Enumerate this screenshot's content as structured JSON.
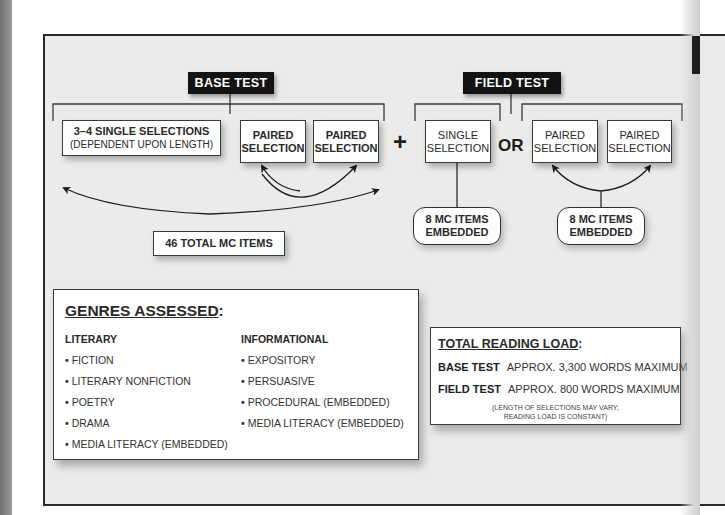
{
  "base_test": {
    "label": "BASE TEST",
    "single_selections": {
      "line1": "3–4 SINGLE SELECTIONS",
      "line2": "(DEPENDENT UPON LENGTH)"
    },
    "paired_selection_1": {
      "line1": "PAIRED",
      "line2": "SELECTION"
    },
    "paired_selection_2": {
      "line1": "PAIRED",
      "line2": "SELECTION"
    },
    "total_items": "46 TOTAL MC ITEMS"
  },
  "operators": {
    "plus": "+",
    "or": "OR"
  },
  "field_test": {
    "label": "FIELD TEST",
    "single_selection": {
      "line1": "SINGLE",
      "line2": "SELECTION"
    },
    "paired_selection_1": {
      "line1": "PAIRED",
      "line2": "SELECTION"
    },
    "paired_selection_2": {
      "line1": "PAIRED",
      "line2": "SELECTION"
    },
    "embedded_single": {
      "line1": "8 MC ITEMS",
      "line2": "EMBEDDED"
    },
    "embedded_paired": {
      "line1": "8 MC ITEMS",
      "line2": "EMBEDDED"
    }
  },
  "genres": {
    "title": "GENRES ASSESSED",
    "title_suffix": ":",
    "literary": {
      "heading": "LITERARY",
      "items": [
        "FICTION",
        "LITERARY NONFICTION",
        "POETRY",
        "DRAMA",
        "MEDIA LITERACY (EMBEDDED)"
      ]
    },
    "informational": {
      "heading": "INFORMATIONAL",
      "items": [
        "EXPOSITORY",
        "PERSUASIVE",
        "PROCEDURAL (EMBEDDED)",
        "MEDIA LITERACY (EMBEDDED)"
      ]
    },
    "bullet": "•"
  },
  "reading_load": {
    "title": "TOTAL READING LOAD",
    "title_suffix": ":",
    "rows": [
      {
        "label": "BASE TEST",
        "value": "APPROX. 3,300 WORDS MAXIMUM"
      },
      {
        "label": "FIELD TEST",
        "value": "APPROX. 800 WORDS MAXIMUM"
      }
    ],
    "note_line1": "(LENGTH OF SELECTIONS MAY VARY;",
    "note_line2": "READING LOAD IS CONSTANT)"
  }
}
